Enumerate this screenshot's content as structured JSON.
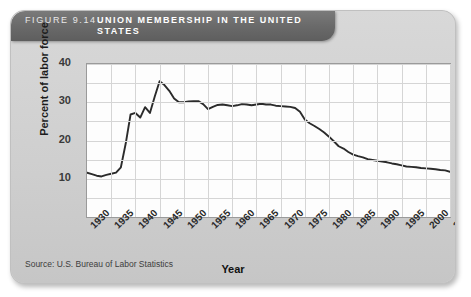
{
  "figure": {
    "number_label": "FIGURE 9.14",
    "title": "UNION MEMBERSHIP IN THE UNITED STATES",
    "source": "Source: U.S. Bureau of Labor Statistics"
  },
  "chart_data": {
    "type": "line",
    "title": "UNION MEMBERSHIP IN THE UNITED STATES",
    "xlabel": "Year",
    "ylabel": "Percent of labor force",
    "xlim": [
      1930,
      2005
    ],
    "ylim": [
      0,
      40
    ],
    "ytick_labels": [
      "10",
      "20",
      "30",
      "40"
    ],
    "yticks": [
      10,
      20,
      30,
      40
    ],
    "xtick_labels": [
      "1930",
      "1935",
      "1940",
      "1945",
      "1950",
      "1955",
      "1960",
      "1965",
      "1970",
      "1975",
      "1980",
      "1985",
      "1990",
      "1995",
      "2000",
      "2005"
    ],
    "xticks": [
      1930,
      1935,
      1940,
      1945,
      1950,
      1955,
      1960,
      1965,
      1970,
      1975,
      1980,
      1985,
      1990,
      1995,
      2000,
      2005
    ],
    "grid": true,
    "legend": "none",
    "line_color": "#2b2b2b",
    "series": [
      {
        "name": "Percent of labor force in unions",
        "x": [
          1930,
          1931,
          1932,
          1933,
          1934,
          1935,
          1936,
          1937,
          1938,
          1939,
          1940,
          1941,
          1942,
          1943,
          1944,
          1945,
          1946,
          1947,
          1948,
          1949,
          1950,
          1951,
          1952,
          1953,
          1954,
          1955,
          1956,
          1957,
          1958,
          1959,
          1960,
          1961,
          1962,
          1963,
          1964,
          1965,
          1966,
          1967,
          1968,
          1969,
          1970,
          1971,
          1972,
          1973,
          1974,
          1975,
          1976,
          1977,
          1978,
          1979,
          1980,
          1981,
          1982,
          1983,
          1984,
          1985,
          1986,
          1987,
          1988,
          1989,
          1990,
          1991,
          1992,
          1993,
          1994,
          1995,
          1996,
          1997,
          1998,
          1999,
          2000,
          2001,
          2002,
          2003,
          2004,
          2005
        ],
        "values": [
          11.6,
          11.2,
          10.8,
          10.6,
          11.0,
          11.3,
          11.6,
          13.0,
          19.2,
          26.8,
          27.2,
          26.0,
          28.7,
          27.2,
          31.5,
          35.5,
          34.5,
          33.0,
          31.0,
          30.0,
          30.0,
          30.2,
          30.3,
          30.3,
          29.5,
          28.2,
          28.8,
          29.3,
          29.4,
          29.2,
          29.0,
          29.2,
          29.5,
          29.4,
          29.2,
          29.4,
          29.6,
          29.4,
          29.4,
          29.1,
          29.0,
          28.9,
          28.8,
          28.5,
          27.5,
          25.5,
          24.5,
          23.8,
          23.0,
          22.1,
          21.0,
          19.8,
          18.5,
          17.9,
          17.0,
          16.3,
          15.9,
          15.6,
          15.1,
          14.9,
          14.7,
          14.5,
          14.3,
          14.0,
          13.8,
          13.5,
          13.2,
          13.1,
          13.0,
          12.8,
          12.7,
          12.6,
          12.5,
          12.3,
          12.2,
          11.8
        ]
      }
    ]
  }
}
